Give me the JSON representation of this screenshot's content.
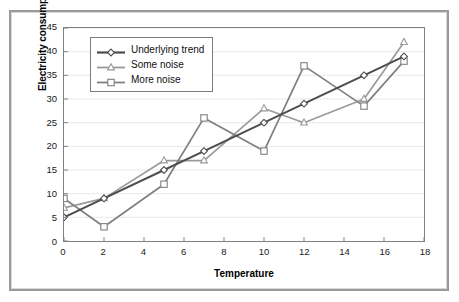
{
  "chart_data": {
    "type": "line",
    "title": "",
    "subtitle": "",
    "xlabel": "Temperature",
    "ylabel": "Electricity consumption",
    "xlim": [
      0,
      18
    ],
    "ylim": [
      0,
      45
    ],
    "xticks": [
      0,
      2,
      4,
      6,
      8,
      10,
      12,
      14,
      16,
      18
    ],
    "yticks": [
      0,
      5,
      10,
      15,
      20,
      25,
      30,
      35,
      40,
      45
    ],
    "xtick_labels": [
      "0",
      "2",
      "4",
      "6",
      "8",
      "10",
      "12",
      "14",
      "16",
      "18"
    ],
    "ytick_labels": [
      "0",
      "5",
      "10",
      "15",
      "20",
      "25",
      "30",
      "35",
      "40",
      "45"
    ],
    "grid": "horizontal",
    "legend_position": "upper-left-inside",
    "x": [
      0,
      2,
      5,
      7,
      10,
      12,
      15,
      17
    ],
    "series": [
      {
        "name": "Underlying trend",
        "values": [
          5,
          9,
          15,
          19,
          25,
          29,
          35,
          39
        ],
        "color": "#4d4d4d",
        "marker": "diamond"
      },
      {
        "name": "Some noise",
        "values": [
          7,
          9,
          17,
          17,
          28,
          25,
          30,
          42
        ],
        "color": "#9a9a9a",
        "marker": "triangle"
      },
      {
        "name": "More noise",
        "values": [
          9,
          3,
          12,
          26,
          19,
          37,
          28.5,
          38
        ],
        "color": "#7f7f7f",
        "marker": "square"
      }
    ]
  },
  "legend": {
    "items": [
      {
        "label": "Underlying trend"
      },
      {
        "label": "Some noise"
      },
      {
        "label": "More noise"
      }
    ]
  },
  "axes": {
    "x_title": "Temperature",
    "y_title": "Electricity consumption"
  },
  "colors": {
    "trend": "#4d4d4d",
    "some_noise": "#9a9a9a",
    "more_noise": "#7f7f7f",
    "axis": "#808080",
    "grid": "#e8e8e8",
    "frame": "#9a9a9a",
    "text": "#000000"
  }
}
